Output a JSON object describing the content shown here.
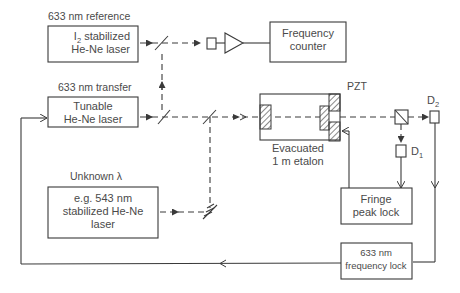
{
  "diagram": {
    "type": "optical-setup-block-diagram",
    "reference_laser": {
      "heading": "633 nm reference",
      "line1": "I",
      "line1_sub": "2",
      "line1_rest": " stabilized",
      "line2": "He-Ne laser"
    },
    "transfer_laser": {
      "heading": "633 nm transfer",
      "line1": "Tunable",
      "line2": "He-Ne laser"
    },
    "unknown_laser": {
      "heading": "Unknown λ",
      "line1": "e.g. 543 nm",
      "line2": "stabilized He-Ne",
      "line3": "laser"
    },
    "frequency_counter": {
      "line1": "Frequency",
      "line2": "counter"
    },
    "etalon": {
      "pzt_label": "PZT",
      "line1": "Evacuated",
      "line2": "1 m etalon"
    },
    "detectors": {
      "d1": "D",
      "d1_sub": "1",
      "d2": "D",
      "d2_sub": "2"
    },
    "fringe_lock": {
      "line1": "Fringe",
      "line2": "peak lock"
    },
    "frequency_lock": {
      "line1": "633 nm",
      "line2": "frequency lock"
    },
    "colors": {
      "line": "#3a3a3a",
      "text": "#4a4a4a",
      "background": "#ffffff"
    }
  }
}
